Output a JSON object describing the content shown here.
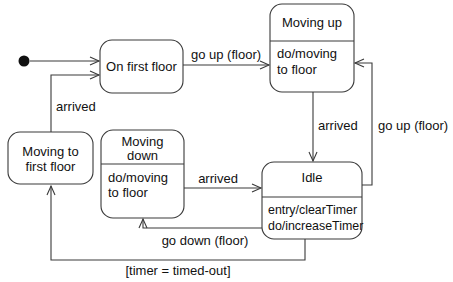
{
  "diagram_type": "uml-state-diagram",
  "colors": {
    "background": "#ffffff",
    "stroke": "#3a3a3a",
    "text": "#111111",
    "state_fill": "#ffffff",
    "initial_dot": "#111111"
  },
  "states": {
    "on_first_floor": {
      "title": "On first floor"
    },
    "moving_up": {
      "title": "Moving up",
      "activity_line1": "do/moving",
      "activity_line2": "to floor"
    },
    "moving_down": {
      "title_line1": "Moving",
      "title_line2": "down",
      "activity_line1": "do/moving",
      "activity_line2": "to floor"
    },
    "idle": {
      "title": "Idle",
      "activity_line1": "entry/clearTimer",
      "activity_line2": "do/increaseTimer"
    },
    "moving_to_first_floor": {
      "title_line1": "Moving to",
      "title_line2": "first floor"
    }
  },
  "transitions": {
    "go_up_from_first_floor": {
      "label": "go up (floor)"
    },
    "moving_up_arrived": {
      "label": "arrived"
    },
    "go_up_from_idle": {
      "label": "go up (floor)"
    },
    "moving_down_arrived": {
      "label": "arrived"
    },
    "go_down_from_idle": {
      "label": "go down (floor)"
    },
    "idle_timer_timeout": {
      "label": "[timer = timed-out]"
    },
    "arrived_first_floor": {
      "label": "arrived"
    }
  }
}
